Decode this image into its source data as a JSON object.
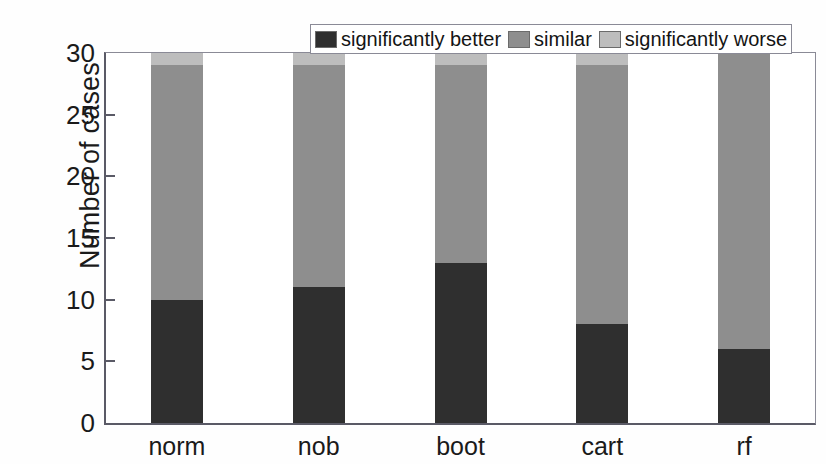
{
  "chart_data": {
    "type": "bar",
    "subtype": "stacked",
    "title": "",
    "xlabel": "",
    "ylabel": "Number of cases",
    "categories": [
      "norm",
      "nob",
      "boot",
      "cart",
      "rf"
    ],
    "series": [
      {
        "name": "significantly better",
        "color": "#2f2f2f",
        "values": [
          10,
          11,
          13,
          8,
          6
        ]
      },
      {
        "name": "similar",
        "color": "#8e8e8e",
        "values": [
          19,
          18,
          16,
          21,
          24
        ]
      },
      {
        "name": "significantly worse",
        "color": "#bdbdbd",
        "values": [
          1,
          1,
          1,
          1,
          0
        ]
      }
    ],
    "ylim": [
      0,
      30
    ],
    "yticks": [
      0,
      5,
      10,
      15,
      20,
      25,
      30
    ],
    "ytick_labels": [
      "0",
      "5",
      "10",
      "15",
      "20",
      "25",
      "30"
    ],
    "grid": false,
    "legend_position": "top-right-inside",
    "stack_total": 30
  },
  "legend": {
    "entries": [
      {
        "label": "significantly better"
      },
      {
        "label": "similar"
      },
      {
        "label": "significantly worse"
      }
    ]
  }
}
